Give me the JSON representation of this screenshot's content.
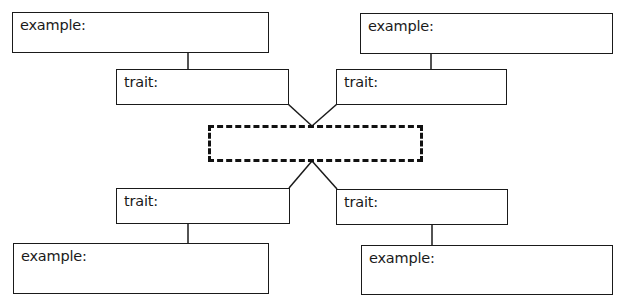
{
  "diagram": {
    "type": "concept-map",
    "center": {
      "label": "",
      "style": "dashed"
    },
    "branches": [
      {
        "position": "top-left",
        "trait": {
          "label": "trait:"
        },
        "example": {
          "label": "example:"
        }
      },
      {
        "position": "top-right",
        "trait": {
          "label": "trait:"
        },
        "example": {
          "label": "example:"
        }
      },
      {
        "position": "bottom-left",
        "trait": {
          "label": "trait:"
        },
        "example": {
          "label": "example:"
        }
      },
      {
        "position": "bottom-right",
        "trait": {
          "label": "trait:"
        },
        "example": {
          "label": "example:"
        }
      }
    ],
    "colors": {
      "stroke": "#1a1a1a",
      "background": "#ffffff"
    }
  }
}
